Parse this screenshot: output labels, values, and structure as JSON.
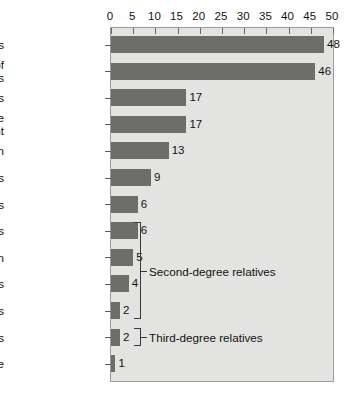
{
  "chart_data": {
    "type": "bar",
    "orientation": "horizontal",
    "title": "",
    "xlabel": "",
    "ylabel": "",
    "xlim": [
      0,
      50
    ],
    "xticks": [
      0,
      5,
      10,
      15,
      20,
      25,
      30,
      35,
      40,
      45,
      50
    ],
    "grid": false,
    "legend": "none",
    "axis_position": "top",
    "bar_color": "#6d6d6b",
    "plot_background": "#e3e3e1",
    "plot_border_color": "#9a9a98",
    "categories": [
      "MZ twins",
      "Offspring of\ndual matings",
      "DZ twins",
      "Siblings with one\naffected parent",
      "Children",
      "Siblings",
      "Parents",
      "Half siblings",
      "Grandchildren",
      "Nephews/Nieces",
      "Uncles/Aunts",
      "First cousins",
      "Baseline"
    ],
    "values": [
      48,
      46,
      17,
      17,
      13,
      9,
      6,
      6,
      5,
      4,
      2,
      2,
      1
    ],
    "value_labels": [
      "48",
      "46",
      "17",
      "17",
      "13",
      "9",
      "6",
      "6",
      "5",
      "4",
      "2",
      "2",
      "1"
    ],
    "annotations": [
      {
        "label": "Second-degree relatives",
        "spans": [
          "Half siblings",
          "Grandchildren",
          "Nephews/Nieces",
          "Uncles/Aunts"
        ]
      },
      {
        "label": "Third-degree relatives",
        "spans": [
          "First cousins"
        ]
      }
    ]
  }
}
